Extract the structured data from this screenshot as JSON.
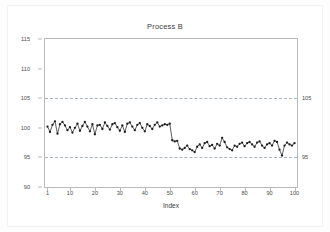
{
  "chart_data": {
    "type": "line",
    "title": "Process B",
    "xlabel": "Index",
    "ylabel": "",
    "xlim": [
      0,
      101
    ],
    "ylim": [
      90,
      115
    ],
    "grid": true,
    "legend": false,
    "yticks": [
      90,
      95,
      100,
      105,
      110,
      115
    ],
    "xticks": [
      1,
      10,
      20,
      30,
      40,
      50,
      60,
      70,
      80,
      90,
      100
    ],
    "right_axis_labels": [
      {
        "value": 105,
        "text": "105"
      },
      {
        "value": 95,
        "text": "95"
      }
    ],
    "reference_lines": [
      {
        "value": 105,
        "style": "dashed",
        "label": "105"
      },
      {
        "value": 95,
        "style": "dashed",
        "label": "95"
      }
    ],
    "series": [
      {
        "name": "Process B",
        "marker": "circle",
        "color": "#1a1a1a",
        "x": [
          1,
          2,
          3,
          4,
          5,
          6,
          7,
          8,
          9,
          10,
          11,
          12,
          13,
          14,
          15,
          16,
          17,
          18,
          19,
          20,
          21,
          22,
          23,
          24,
          25,
          26,
          27,
          28,
          29,
          30,
          31,
          32,
          33,
          34,
          35,
          36,
          37,
          38,
          39,
          40,
          41,
          42,
          43,
          44,
          45,
          46,
          47,
          48,
          49,
          50,
          51,
          52,
          53,
          54,
          55,
          56,
          57,
          58,
          59,
          60,
          61,
          62,
          63,
          64,
          65,
          66,
          67,
          68,
          69,
          70,
          71,
          72,
          73,
          74,
          75,
          76,
          77,
          78,
          79,
          80,
          81,
          82,
          83,
          84,
          85,
          86,
          87,
          88,
          89,
          90,
          91,
          92,
          93,
          94,
          95,
          96,
          97,
          98,
          99,
          100
        ],
        "values": [
          100.2,
          99.3,
          100.5,
          101.1,
          99.0,
          100.6,
          101.0,
          100.4,
          99.6,
          100.1,
          99.2,
          100.0,
          100.7,
          99.5,
          100.3,
          101.0,
          100.2,
          99.4,
          100.6,
          98.9,
          100.4,
          100.5,
          99.8,
          100.9,
          100.3,
          99.7,
          100.6,
          100.8,
          100.1,
          99.5,
          100.4,
          99.3,
          100.7,
          100.9,
          100.2,
          99.6,
          100.5,
          100.8,
          100.0,
          99.4,
          100.6,
          100.3,
          99.8,
          100.5,
          100.9,
          100.2,
          100.4,
          100.6,
          100.5,
          100.7,
          97.9,
          97.7,
          97.8,
          96.5,
          96.3,
          96.6,
          97.0,
          96.4,
          96.2,
          95.9,
          96.8,
          97.2,
          96.6,
          97.4,
          97.6,
          96.9,
          97.1,
          96.5,
          97.3,
          97.0,
          98.3,
          97.6,
          96.7,
          96.4,
          96.2,
          97.0,
          96.8,
          97.3,
          97.5,
          96.9,
          97.4,
          97.6,
          97.2,
          96.8,
          97.5,
          97.7,
          97.0,
          96.6,
          97.2,
          97.4,
          97.0,
          97.8,
          97.6,
          96.3,
          95.3,
          97.0,
          97.5,
          97.2,
          97.0,
          97.4
        ]
      }
    ]
  },
  "axis": {
    "ytick_labels": [
      "115",
      "110",
      "105",
      "100",
      "95",
      "90"
    ],
    "xtick_labels": [
      "1",
      "10",
      "20",
      "30",
      "40",
      "50",
      "60",
      "70",
      "80",
      "90",
      "100"
    ],
    "right_labels": [
      "105",
      "95"
    ]
  }
}
